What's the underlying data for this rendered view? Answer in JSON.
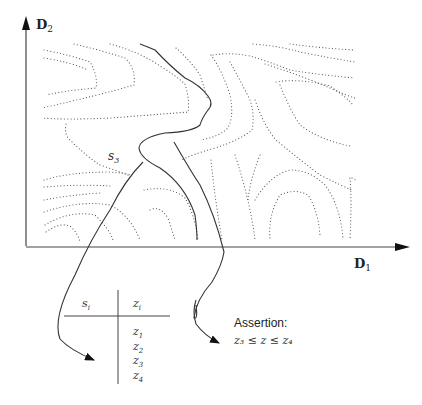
{
  "diagram": {
    "axes": {
      "y_label_main": "D",
      "y_label_sub": "2",
      "x_label_main": "D",
      "x_label_sub": "1"
    },
    "region_label_main": "s",
    "region_label_sub": "3",
    "table": {
      "header_left_main": "s",
      "header_left_sub": "i",
      "header_right_main": "z",
      "header_right_sub": "i",
      "rows": [
        {
          "main": "z",
          "sub": "1"
        },
        {
          "main": "z",
          "sub": "2"
        },
        {
          "main": "z",
          "sub": "3"
        },
        {
          "main": "z",
          "sub": "4"
        }
      ]
    },
    "assertion": {
      "title": "Assertion:",
      "formula": "z₃ ≤ z ≤ z₄"
    },
    "colors": {
      "line": "#333333",
      "dotted": "#555555",
      "background": "#ffffff"
    }
  }
}
